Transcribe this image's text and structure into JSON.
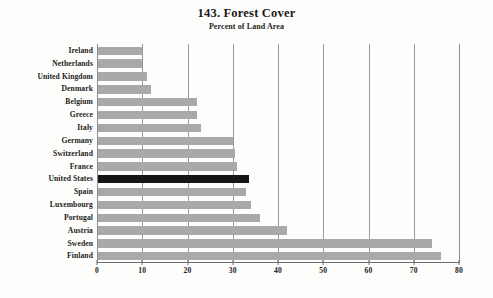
{
  "chart_data": {
    "type": "bar",
    "orientation": "horizontal",
    "title": "143. Forest Cover",
    "subtitle": "Percent of Land Area",
    "xlabel": "",
    "ylabel": "",
    "xlim": [
      0,
      80
    ],
    "xticks": [
      0,
      10,
      20,
      30,
      40,
      50,
      60,
      70,
      80
    ],
    "grid": true,
    "legend": "none",
    "highlight_category": "United States",
    "highlight_color": "#151515",
    "bar_color": "#a9a9a9",
    "background_color": "#fdfdfb",
    "categories": [
      "Ireland",
      "Netherlands",
      "United Kingdom",
      "Denmark",
      "Belgium",
      "Greece",
      "Italy",
      "Germany",
      "Switzerland",
      "France",
      "United States",
      "Spain",
      "Luxembourg",
      "Portugal",
      "Austria",
      "Sweden",
      "Finland"
    ],
    "values": [
      10,
      10,
      11,
      12,
      22,
      22,
      23,
      30,
      30.5,
      31,
      33.5,
      33,
      34,
      36,
      42,
      74,
      76
    ]
  }
}
